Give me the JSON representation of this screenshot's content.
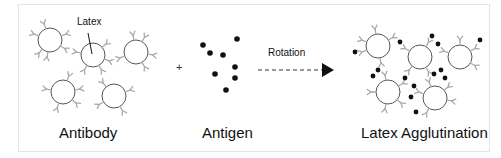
{
  "diagram": {
    "type": "latex-agglutination-schematic",
    "labels": {
      "latex": "Latex",
      "plus": "+",
      "rotation": "Rotation",
      "antibody_caption": "Antibody",
      "antigen_caption": "Antigen",
      "agglutination_caption": "Latex Agglutination"
    },
    "colors": {
      "circle_stroke": "#555555",
      "antibody_stroke": "#aaaaaa",
      "antigen_fill": "#111111",
      "arrow": "#111111",
      "frame_border": "#e4e4e4"
    },
    "panels": [
      {
        "id": "antibody",
        "caption": "Antibody"
      },
      {
        "id": "antigen",
        "caption": "Antigen"
      },
      {
        "id": "agglutination",
        "caption": "Latex Agglutination"
      }
    ],
    "antibody_particles": [
      {
        "cx": 50,
        "cy": 40,
        "r": 12,
        "antibody_angles": [
          -110,
          -20,
          30,
          100,
          130,
          200
        ]
      },
      {
        "cx": 93,
        "cy": 55,
        "r": 12,
        "antibody_angles": [
          -40,
          20,
          60,
          120,
          190
        ]
      },
      {
        "cx": 136,
        "cy": 52,
        "r": 12,
        "antibody_angles": [
          -100,
          -60,
          10,
          60,
          160
        ]
      },
      {
        "cx": 63,
        "cy": 92,
        "r": 12,
        "antibody_angles": [
          -70,
          -10,
          40,
          110,
          190
        ]
      },
      {
        "cx": 114,
        "cy": 96,
        "r": 12,
        "antibody_angles": [
          -130,
          -20,
          60,
          150
        ]
      }
    ],
    "antigens": [
      {
        "cx": 203,
        "cy": 45
      },
      {
        "cx": 237,
        "cy": 39
      },
      {
        "cx": 210,
        "cy": 53
      },
      {
        "cx": 223,
        "cy": 55
      },
      {
        "cx": 235,
        "cy": 67
      },
      {
        "cx": 215,
        "cy": 74
      },
      {
        "cx": 235,
        "cy": 78
      },
      {
        "cx": 226,
        "cy": 90
      }
    ],
    "agglutinated_particles": [
      {
        "cx": 378,
        "cy": 46,
        "r": 12,
        "antibody_angles": [
          -100,
          -30,
          160,
          200,
          80
        ]
      },
      {
        "cx": 420,
        "cy": 57,
        "r": 12,
        "antibody_angles": [
          -150,
          -60,
          130,
          60
        ]
      },
      {
        "cx": 460,
        "cy": 57,
        "r": 12,
        "antibody_angles": [
          -90,
          -30,
          30,
          200
        ]
      },
      {
        "cx": 388,
        "cy": 92,
        "r": 12,
        "antibody_angles": [
          -100,
          -30,
          40,
          100,
          180
        ]
      },
      {
        "cx": 435,
        "cy": 98,
        "r": 12,
        "antibody_angles": [
          -110,
          -40,
          10,
          120,
          200
        ]
      }
    ],
    "bound_antigens": [
      {
        "cx": 355,
        "cy": 52
      },
      {
        "cx": 400,
        "cy": 42
      },
      {
        "cx": 378,
        "cy": 70
      },
      {
        "cx": 373,
        "cy": 76
      },
      {
        "cx": 432,
        "cy": 36
      },
      {
        "cx": 438,
        "cy": 44
      },
      {
        "cx": 480,
        "cy": 40
      },
      {
        "cx": 441,
        "cy": 70
      },
      {
        "cx": 445,
        "cy": 78
      },
      {
        "cx": 405,
        "cy": 78
      },
      {
        "cx": 414,
        "cy": 86
      },
      {
        "cx": 411,
        "cy": 97
      },
      {
        "cx": 416,
        "cy": 112
      },
      {
        "cx": 434,
        "cy": 74
      }
    ],
    "arrow": {
      "x1": 258,
      "x2": 322,
      "y": 70,
      "tip_x": 334
    }
  }
}
